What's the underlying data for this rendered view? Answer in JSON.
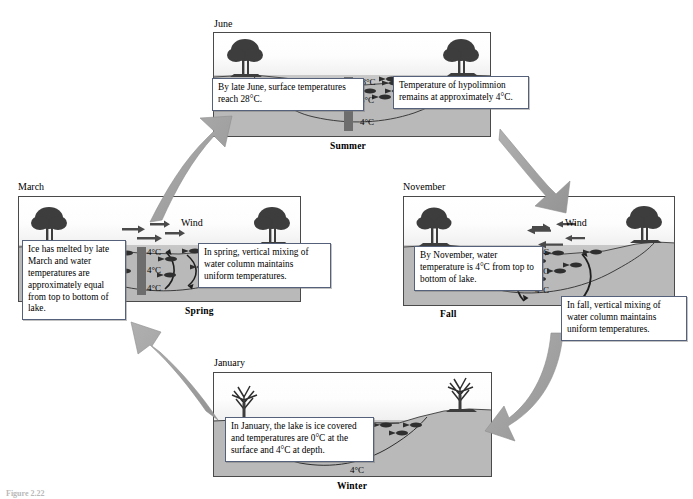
{
  "figure": {
    "caption": "Figure 2.22"
  },
  "colors": {
    "panel_border": "#4a4a4a",
    "water": "#bdbdbd",
    "sky": "#fdfdfd",
    "arrow_gray": "#9d9d9d",
    "callout_border": "#55607a",
    "thermocline_bar": "#6a6a6a",
    "tree": "#404040",
    "text": "#000000"
  },
  "panels": {
    "summer": {
      "month": "June",
      "season": "Summer",
      "wind": "",
      "temps": [
        "28°C",
        "8°C",
        "4°C"
      ],
      "callouts": [
        {
          "id": "summer-left",
          "text": "By late June, surface temperatures reach 28°C."
        },
        {
          "id": "summer-right",
          "text": "Temperature of hypolimnion remains at approximately 4°C."
        }
      ]
    },
    "spring": {
      "month": "March",
      "season": "Spring",
      "wind": "Wind",
      "temps": [
        "4°C",
        "4°C",
        "4°C"
      ],
      "callouts": [
        {
          "id": "spring-left",
          "text": "Ice has melted by late March and water temperatures are approximately equal from top to bottom of lake."
        },
        {
          "id": "spring-right",
          "text": "In spring, vertical mixing of water column maintains uniform temperatures."
        }
      ]
    },
    "fall": {
      "month": "November",
      "season": "Fall",
      "wind": "Wind",
      "temps": [
        "4°C",
        "4°C",
        "4°C"
      ],
      "callouts": [
        {
          "id": "fall-left",
          "text": "By November, water temperature is 4°C from top to bottom of lake."
        },
        {
          "id": "fall-right",
          "text": "In fall, vertical mixing of water column maintains uniform temperatures."
        }
      ]
    },
    "winter": {
      "month": "January",
      "season": "Winter",
      "wind": "",
      "temps": [
        "0°C",
        "3°C",
        "4°C"
      ],
      "callouts": [
        {
          "id": "winter-left",
          "text": "In January, the lake is ice covered and temperatures are 0°C at the surface and 4°C at depth."
        }
      ]
    }
  },
  "cycle": {
    "direction": "clockwise",
    "arrows": [
      {
        "name": "spring-to-summer",
        "from": "Spring",
        "to": "Summer"
      },
      {
        "name": "summer-to-fall",
        "from": "Summer",
        "to": "Fall"
      },
      {
        "name": "fall-to-winter",
        "from": "Fall",
        "to": "Winter"
      },
      {
        "name": "winter-to-spring",
        "from": "Winter",
        "to": "Spring"
      }
    ]
  }
}
